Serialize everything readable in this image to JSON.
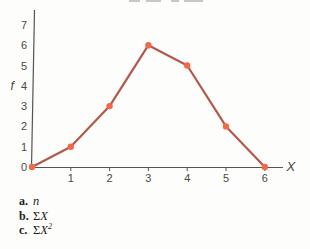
{
  "figure": {
    "y_axis_letter": "f",
    "x_axis_letter": "X"
  },
  "chart_data": {
    "type": "line",
    "x": [
      0,
      1,
      2,
      3,
      4,
      5,
      6
    ],
    "values": [
      0,
      1,
      3,
      6,
      5,
      2,
      0
    ],
    "title": "",
    "xlabel": "X",
    "ylabel": "f",
    "x_ticks": [
      1,
      2,
      3,
      4,
      5,
      6
    ],
    "y_ticks": [
      0,
      1,
      2,
      3,
      4,
      5,
      6,
      7
    ],
    "xlim": [
      0,
      6.5
    ],
    "ylim": [
      0,
      7.8
    ],
    "grid": false,
    "legend": false,
    "line_color": "#b2594c",
    "marker_color": "#f1694a",
    "axis_color": "#55544f",
    "label_color": "#4a4944"
  },
  "questions": [
    {
      "label": "a.",
      "sigma": "",
      "variable": "n",
      "sup": ""
    },
    {
      "label": "b.",
      "sigma": "Σ",
      "variable": "X",
      "sup": ""
    },
    {
      "label": "c.",
      "sigma": "Σ",
      "variable": "X",
      "sup": "2"
    }
  ]
}
